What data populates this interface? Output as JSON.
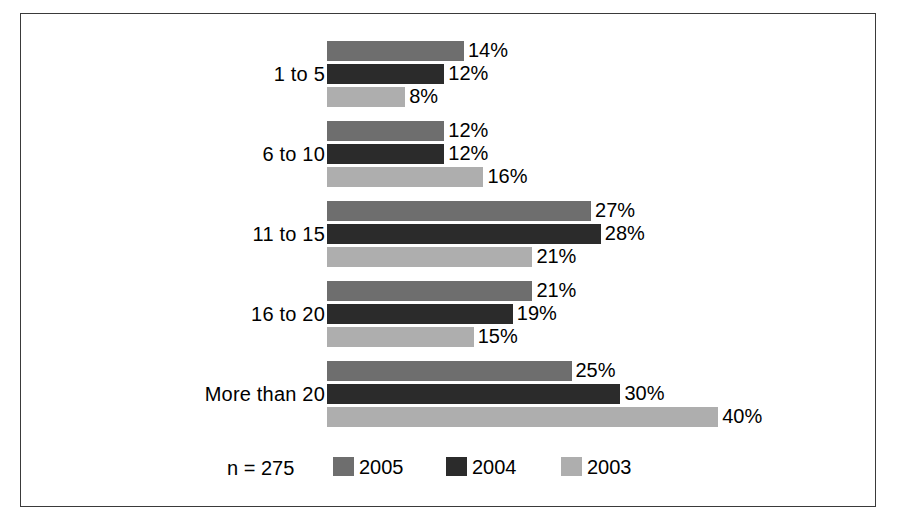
{
  "chart_data": {
    "type": "bar",
    "orientation": "horizontal",
    "title": "",
    "subtitle": "",
    "xlabel": "",
    "ylabel": "",
    "xlim": [
      0,
      40
    ],
    "grid": false,
    "value_suffix": "%",
    "categories": [
      "1 to 5",
      "6 to 10",
      "11 to 15",
      "16 to 20",
      "More than 20"
    ],
    "series": [
      {
        "name": "2005",
        "color": "#6e6e6e",
        "values": [
          14,
          12,
          27,
          21,
          25
        ]
      },
      {
        "name": "2004",
        "color": "#2b2b2b",
        "values": [
          12,
          12,
          28,
          19,
          30
        ]
      },
      {
        "name": "2003",
        "color": "#aeaeae",
        "values": [
          8,
          16,
          21,
          15,
          40
        ]
      }
    ],
    "data_labels": [
      [
        "14%",
        "12%",
        "8%"
      ],
      [
        "12%",
        "12%",
        "16%"
      ],
      [
        "27%",
        "28%",
        "21%"
      ],
      [
        "21%",
        "19%",
        "15%"
      ],
      [
        "25%",
        "30%",
        "40%"
      ]
    ],
    "annotations": {
      "sample_size": "n = 275"
    },
    "legend": {
      "position": "bottom",
      "entries": [
        {
          "label": "2005",
          "color": "#6e6e6e"
        },
        {
          "label": "2004",
          "color": "#2b2b2b"
        },
        {
          "label": "2003",
          "color": "#aeaeae"
        }
      ]
    },
    "scale": {
      "px_per_percent": 9.78,
      "bar_height_px": 20
    }
  },
  "figure": {
    "border_color": "#3a3a3a",
    "background": "#ffffff"
  }
}
